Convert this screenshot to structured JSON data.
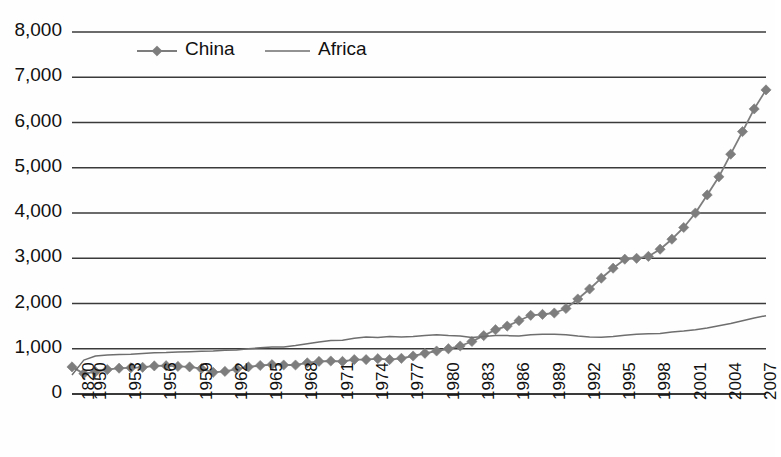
{
  "chart_data": {
    "type": "line",
    "title": "",
    "subtitle": "",
    "xlabel": "",
    "ylabel": "",
    "ylim": [
      0,
      8000
    ],
    "ytick_labels": [
      "0",
      "1,000",
      "2,000",
      "3,000",
      "4,000",
      "5,000",
      "6,000",
      "7,000",
      "8,000"
    ],
    "ytick_values": [
      0,
      1000,
      2000,
      3000,
      4000,
      5000,
      6000,
      7000,
      8000
    ],
    "grid": "horizontal",
    "legend_position": "top-center",
    "legend": [
      "China",
      "Africa"
    ],
    "colors": {
      "china": "#7d7d7d",
      "africa": "#6e6e6e",
      "grid": "#3a3a3a",
      "text": "#111111"
    },
    "x": [
      1820,
      1950,
      1951,
      1952,
      1953,
      1954,
      1955,
      1956,
      1957,
      1958,
      1959,
      1960,
      1961,
      1962,
      1963,
      1964,
      1965,
      1966,
      1967,
      1968,
      1969,
      1970,
      1971,
      1972,
      1973,
      1974,
      1975,
      1976,
      1977,
      1978,
      1979,
      1980,
      1981,
      1982,
      1983,
      1984,
      1985,
      1986,
      1987,
      1988,
      1989,
      1990,
      1991,
      1992,
      1993,
      1994,
      1995,
      1996,
      1997,
      1998,
      1999,
      2000,
      2001,
      2002,
      2003,
      2004,
      2005,
      2006,
      2007,
      2008
    ],
    "xtick_labels": [
      "1820",
      "1950",
      "1953",
      "1956",
      "1959",
      "1962",
      "1965",
      "1968",
      "1971",
      "1974",
      "1977",
      "1980",
      "1983",
      "1986",
      "1989",
      "1992",
      "1995",
      "1998",
      "2001",
      "2004",
      "2007"
    ],
    "xtick_x": [
      1820,
      1950,
      1953,
      1956,
      1959,
      1962,
      1965,
      1968,
      1971,
      1974,
      1977,
      1980,
      1983,
      1986,
      1989,
      1992,
      1995,
      1998,
      2001,
      2004,
      2007
    ],
    "series": [
      {
        "name": "China",
        "marker": "diamond",
        "values": [
          600,
          450,
          490,
          540,
          570,
          580,
          590,
          620,
          625,
          610,
          600,
          560,
          480,
          500,
          550,
          600,
          630,
          650,
          640,
          640,
          690,
          720,
          730,
          720,
          760,
          760,
          780,
          760,
          790,
          840,
          900,
          950,
          1000,
          1060,
          1160,
          1290,
          1420,
          1500,
          1620,
          1740,
          1760,
          1790,
          1890,
          2100,
          2320,
          2560,
          2780,
          2980,
          3000,
          3040,
          3200,
          3420,
          3680,
          4000,
          4400,
          4800,
          5300,
          5800,
          6300,
          6720
        ]
      },
      {
        "name": "Africa",
        "marker": "none",
        "values": [
          420,
          750,
          840,
          860,
          870,
          880,
          895,
          910,
          915,
          925,
          935,
          945,
          950,
          965,
          975,
          1000,
          1020,
          1040,
          1040,
          1070,
          1110,
          1150,
          1180,
          1190,
          1230,
          1260,
          1250,
          1270,
          1260,
          1270,
          1290,
          1310,
          1290,
          1280,
          1250,
          1270,
          1290,
          1290,
          1280,
          1310,
          1320,
          1320,
          1310,
          1280,
          1260,
          1255,
          1270,
          1300,
          1320,
          1330,
          1340,
          1370,
          1390,
          1420,
          1460,
          1510,
          1560,
          1620,
          1680,
          1730
        ]
      }
    ]
  }
}
